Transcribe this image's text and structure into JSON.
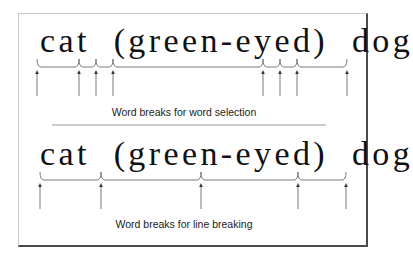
{
  "diagram": {
    "frame": {
      "border_light": "#c8c8c8",
      "border_dark": "#4a4a4a"
    },
    "panels": [
      {
        "id": "word-selection",
        "sample_text": "cat  (green-eyed)  dog",
        "caption": "Word breaks for word selection",
        "bracket_y": 67,
        "arrow_top": 70,
        "arrow_bottom": 96,
        "break_positions_x": [
          37,
          79,
          96,
          113,
          263,
          280,
          297,
          347
        ],
        "segments": [
          "cat",
          " ",
          "(",
          "green-eyed",
          ")",
          " ",
          "dog"
        ]
      },
      {
        "id": "line-breaking",
        "sample_text": "cat  (green-eyed)  dog",
        "caption": "Word breaks for line breaking",
        "bracket_y": 180,
        "arrow_top": 183,
        "arrow_bottom": 209,
        "break_positions_x": [
          40,
          101,
          201,
          298,
          346
        ],
        "segments": [
          "cat ",
          "(green-",
          "eyed) ",
          "dog"
        ]
      }
    ],
    "divider": {
      "x1": 52,
      "x2": 326,
      "y": 125,
      "color": "#9a9a9a"
    },
    "line_color": "#7a7a7a"
  }
}
